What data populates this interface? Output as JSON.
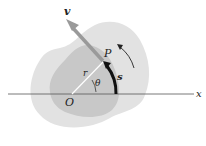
{
  "diagram": {
    "type": "rigid-body-rotation",
    "labels": {
      "velocity": "v",
      "point": "P",
      "origin": "O",
      "radius": "r",
      "angle": "θ",
      "arc_length": "s",
      "x_axis": "x"
    },
    "colors": {
      "outer_body": "#e2e2e2",
      "inner_body": "#c8c8c8",
      "velocity_arrow": "#9a9a9a",
      "arc_arrow": "#111111",
      "axis": "#555555",
      "radius_line": "#ffffff"
    }
  }
}
